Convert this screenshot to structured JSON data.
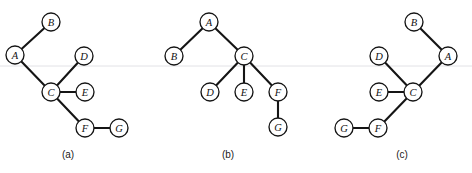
{
  "figure": {
    "background_color": "#ffffff",
    "edge_color": "#151515",
    "node_fill_color": "#ffffff",
    "node_stroke_color": "#151515",
    "guide_line_color": "#e2e2e6",
    "node_radius": 9,
    "guide_line_y": 66,
    "width": 472,
    "height": 173
  },
  "chart_data": {
    "type": "diagram",
    "title": "",
    "panels": [
      {
        "caption": "(a)",
        "caption_x": 68,
        "caption_y": 154,
        "nodes": [
          {
            "label": "A",
            "x": 15,
            "y": 55
          },
          {
            "label": "B",
            "x": 51,
            "y": 22
          },
          {
            "label": "C",
            "x": 51,
            "y": 92
          },
          {
            "label": "D",
            "x": 84,
            "y": 56
          },
          {
            "label": "E",
            "x": 85,
            "y": 92
          },
          {
            "label": "F",
            "x": 85,
            "y": 128
          },
          {
            "label": "G",
            "x": 119,
            "y": 128
          }
        ],
        "edges": [
          {
            "from": "A",
            "to": "B"
          },
          {
            "from": "A",
            "to": "C"
          },
          {
            "from": "C",
            "to": "D"
          },
          {
            "from": "C",
            "to": "E"
          },
          {
            "from": "C",
            "to": "F"
          },
          {
            "from": "F",
            "to": "G"
          }
        ]
      },
      {
        "caption": "(b)",
        "caption_x": 228,
        "caption_y": 154,
        "nodes": [
          {
            "label": "A",
            "x": 209,
            "y": 22
          },
          {
            "label": "B",
            "x": 174,
            "y": 56
          },
          {
            "label": "C",
            "x": 244,
            "y": 56
          },
          {
            "label": "D",
            "x": 210,
            "y": 92
          },
          {
            "label": "E",
            "x": 244,
            "y": 92
          },
          {
            "label": "F",
            "x": 278,
            "y": 92
          },
          {
            "label": "G",
            "x": 278,
            "y": 127
          }
        ],
        "edges": [
          {
            "from": "A",
            "to": "B"
          },
          {
            "from": "A",
            "to": "C"
          },
          {
            "from": "C",
            "to": "D"
          },
          {
            "from": "C",
            "to": "E"
          },
          {
            "from": "C",
            "to": "F"
          },
          {
            "from": "F",
            "to": "G"
          }
        ]
      },
      {
        "caption": "(c)",
        "caption_x": 402,
        "caption_y": 154,
        "nodes": [
          {
            "label": "A",
            "x": 448,
            "y": 56
          },
          {
            "label": "B",
            "x": 414,
            "y": 22
          },
          {
            "label": "C",
            "x": 413,
            "y": 92
          },
          {
            "label": "D",
            "x": 379,
            "y": 56
          },
          {
            "label": "E",
            "x": 379,
            "y": 92
          },
          {
            "label": "F",
            "x": 378,
            "y": 128
          },
          {
            "label": "G",
            "x": 344,
            "y": 128
          }
        ],
        "edges": [
          {
            "from": "A",
            "to": "B"
          },
          {
            "from": "A",
            "to": "C"
          },
          {
            "from": "C",
            "to": "D"
          },
          {
            "from": "C",
            "to": "E"
          },
          {
            "from": "C",
            "to": "F"
          },
          {
            "from": "F",
            "to": "G"
          }
        ]
      }
    ]
  }
}
